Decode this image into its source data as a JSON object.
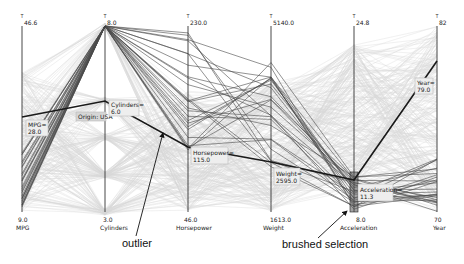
{
  "chart_data": {
    "type": "parallel-coordinates",
    "title": "",
    "dataset": "cars",
    "axes": [
      {
        "name": "MPG",
        "max": "46.6",
        "min": "9.0",
        "x": 22
      },
      {
        "name": "Cylinders",
        "max": "8.0",
        "min": "3.0",
        "x": 105
      },
      {
        "name": "Horsepower",
        "max": "230.0",
        "min": "46.0",
        "x": 188
      },
      {
        "name": "Weight",
        "max": "5140.0",
        "min": "1613.0",
        "x": 271
      },
      {
        "name": "Acceleration",
        "max": "24.8",
        "min": "8.0",
        "x": 354
      },
      {
        "name": "Year",
        "max": "82",
        "min": "70",
        "x": 437
      }
    ],
    "highlighted_record": {
      "MPG": 28.0,
      "Cylinders": 6.0,
      "Horsepower": 115.0,
      "Weight": 2595.0,
      "Acceleration": 11.3,
      "Year": 79.0,
      "Origin": "USA"
    },
    "brush": {
      "axis": "Acceleration",
      "range_approx": [
        8.0,
        11.5
      ]
    },
    "annotations": [
      "outlier",
      "brushed selection"
    ]
  },
  "tooltips": {
    "mpg": {
      "label": "MPG=",
      "value": "28.0"
    },
    "origin": {
      "label": "Origin: USA"
    },
    "cylinders": {
      "label": "Cylinders=",
      "value": "6.0"
    },
    "horsepower": {
      "label": "Horsepower=",
      "value": "115.0"
    },
    "weight": {
      "label": "Weight=",
      "value": "2595.0"
    },
    "acceleration": {
      "label": "Acceleration=",
      "value": "11.3"
    },
    "year": {
      "label": "Year=",
      "value": "79.0"
    }
  },
  "annotations": {
    "outlier": "outlier",
    "brushed": "brushed selection"
  },
  "axes_labels": {
    "mpg": {
      "max": "46.6",
      "min": "9.0",
      "name": "MPG"
    },
    "cyl": {
      "max": "8.0",
      "min": "3.0",
      "name": "Cylinders"
    },
    "hp": {
      "max": "230.0",
      "min": "46.0",
      "name": "Horsepower"
    },
    "wt": {
      "max": "5140.0",
      "min": "1613.0",
      "name": "Weight"
    },
    "acc": {
      "max": "24.8",
      "min": "8.0",
      "name": "Acceleration"
    },
    "yr": {
      "max": "82",
      "min": "70",
      "name": "Year"
    }
  },
  "colors": {
    "context_lines": "#c8c8c8",
    "selected_lines": "#444444",
    "highlight_line": "#1a1a1a",
    "axis": "#333333"
  }
}
